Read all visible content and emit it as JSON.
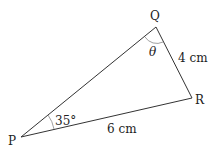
{
  "diagram": {
    "vertices": {
      "P": {
        "label": "P"
      },
      "Q": {
        "label": "Q"
      },
      "R": {
        "label": "R"
      }
    },
    "angles": {
      "P": {
        "label": "35°"
      },
      "Q": {
        "label": "θ"
      }
    },
    "sides": {
      "QR": {
        "label": "4 cm"
      },
      "PR": {
        "label": "6 cm"
      }
    },
    "colors": {
      "line": "#333333",
      "arc": "#888888"
    }
  }
}
